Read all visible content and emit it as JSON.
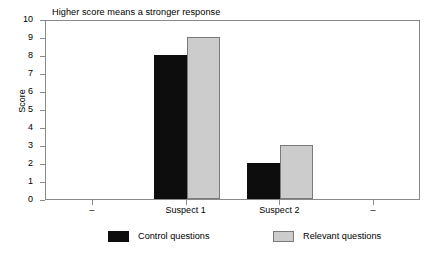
{
  "chart_data": {
    "type": "bar",
    "title": "Higher score means a stronger response",
    "xlabel": "",
    "ylabel": "Score",
    "ylim": [
      0,
      10
    ],
    "ytick_labels": [
      "0",
      "1",
      "2",
      "3",
      "4",
      "5",
      "6",
      "7",
      "8",
      "9",
      "10"
    ],
    "ytick_values": [
      0,
      1,
      2,
      3,
      4,
      5,
      6,
      7,
      8,
      9,
      10
    ],
    "categories": [
      "–",
      "Suspect 1",
      "Suspect 2",
      "–"
    ],
    "grid": false,
    "legend_position": "bottom",
    "series": [
      {
        "name": "Control questions",
        "color": "#0d0d0d",
        "values": [
          null,
          8,
          2,
          null
        ]
      },
      {
        "name": "Relevant questions",
        "color": "#cccccc",
        "values": [
          null,
          9,
          3,
          null
        ]
      }
    ]
  },
  "axes": {
    "ylabel": "Score",
    "yticks": [
      {
        "label": "10",
        "value": 10
      },
      {
        "label": "9",
        "value": 9
      },
      {
        "label": "8",
        "value": 8
      },
      {
        "label": "7",
        "value": 7
      },
      {
        "label": "6",
        "value": 6
      },
      {
        "label": "5",
        "value": 5
      },
      {
        "label": "4",
        "value": 4
      },
      {
        "label": "3",
        "value": 3
      },
      {
        "label": "2",
        "value": 2
      },
      {
        "label": "1",
        "value": 1
      },
      {
        "label": "0",
        "value": 0
      }
    ],
    "xticks": [
      {
        "label": "–"
      },
      {
        "label": "Suspect 1"
      },
      {
        "label": "Suspect 2"
      },
      {
        "label": "–"
      }
    ]
  },
  "legend": {
    "items": [
      {
        "label": "Control questions",
        "color": "#0d0d0d"
      },
      {
        "label": "Relevant questions",
        "color": "#cccccc"
      }
    ]
  },
  "colors": {
    "control": "#0d0d0d",
    "relevant": "#cccccc",
    "frame": "#8a8a8a",
    "background": "#ffffff"
  }
}
